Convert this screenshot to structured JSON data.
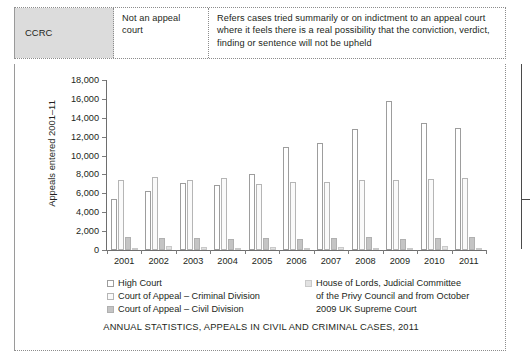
{
  "table": {
    "row": {
      "code": "CCRC",
      "court_status": "Not an appeal court",
      "description": "Refers cases tried summarily or on indictment to an appeal court where it feels there is a real possibility that the conviction, verdict, finding or sentence will not be upheld"
    }
  },
  "caption": "ANNUAL STATISTICS, APPEALS IN CIVIL AND CRIMINAL CASES, 2011",
  "legend": {
    "column_a": [
      {
        "label": "High Court",
        "swatch": "#ffffff"
      },
      {
        "label": "Court of Appeal – Criminal Division",
        "swatch": "#fafafa"
      },
      {
        "label": "Court of Appeal – Civil Division",
        "swatch": "#c4c4c4"
      }
    ],
    "column_b": {
      "swatch": "#e2e2e2",
      "line1": "House of Lords, Judicial Committee",
      "line2": "of the Privy Council and from October",
      "line3": "2009 UK Supreme Court"
    }
  },
  "chart_data": {
    "type": "bar",
    "title": "",
    "xlabel": "",
    "ylabel": "Appeals entered 2001–11",
    "ylim": [
      0,
      18000
    ],
    "ytick_labels": [
      "18,000",
      "16,000",
      "14,000",
      "12,000",
      "10,000",
      "8,000",
      "6,000",
      "4,000",
      "2,000",
      "0"
    ],
    "ytick_values": [
      18000,
      16000,
      14000,
      12000,
      10000,
      8000,
      6000,
      4000,
      2000,
      0
    ],
    "grid": false,
    "legend_position": "below",
    "categories": [
      "2001",
      "2002",
      "2003",
      "2004",
      "2005",
      "2006",
      "2007",
      "2008",
      "2009",
      "2010",
      "2011"
    ],
    "series": [
      {
        "name": "High Court",
        "values": [
          5400,
          6200,
          7050,
          6850,
          8050,
          10900,
          11350,
          12800,
          15800,
          13400,
          12900
        ]
      },
      {
        "name": "Court of Appeal – Criminal Division",
        "values": [
          7400,
          7700,
          7450,
          7600,
          7000,
          7250,
          7200,
          7450,
          7450,
          7500,
          7600
        ]
      },
      {
        "name": "Court of Appeal – Civil Division",
        "values": [
          1400,
          1300,
          1250,
          1150,
          1300,
          1200,
          1250,
          1350,
          1200,
          1250,
          1400
        ]
      },
      {
        "name": "House of Lords, Judicial Committee of the Privy Council and from October 2009 UK Supreme Court",
        "values": [
          150,
          400,
          300,
          250,
          300,
          250,
          300,
          250,
          200,
          400,
          250
        ]
      }
    ]
  }
}
